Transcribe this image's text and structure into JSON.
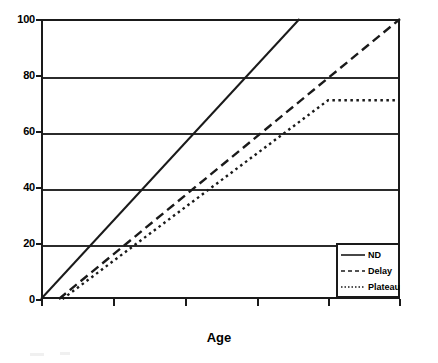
{
  "chart_data": {
    "type": "line",
    "title": "",
    "xlabel": "Age",
    "ylabel": "",
    "ylim": [
      0,
      100
    ],
    "xlim": [
      0,
      100
    ],
    "grid": true,
    "y_ticks": [
      0,
      20,
      40,
      60,
      80,
      100
    ],
    "y_tick_labels": [
      "0",
      "20",
      "40",
      "60",
      "80",
      "100"
    ],
    "x_ticks": [
      0,
      20,
      40,
      60,
      80,
      100
    ],
    "x_tick_labels": [
      "",
      "",
      "",
      "",
      "",
      ""
    ],
    "legend_position": "lower right",
    "series": [
      {
        "name": "ND",
        "style": "solid",
        "color": "#1a1a1a",
        "x": [
          0,
          72
        ],
        "y": [
          0,
          100
        ]
      },
      {
        "name": "Delay",
        "style": "dashed",
        "color": "#1a1a1a",
        "x": [
          5,
          100
        ],
        "y": [
          0,
          100
        ]
      },
      {
        "name": "Plateau",
        "style": "dotted",
        "color": "#1a1a1a",
        "x": [
          6,
          80,
          100
        ],
        "y": [
          0,
          71,
          71
        ]
      }
    ]
  },
  "axis": {
    "y_labels": [
      "100",
      "80",
      "60",
      "40",
      "20",
      "0"
    ],
    "x_title": "Age"
  },
  "legend": {
    "items": [
      {
        "label": "ND",
        "style": "solid"
      },
      {
        "label": "Delay",
        "style": "dashed"
      },
      {
        "label": "Plateau",
        "style": "dotted"
      }
    ]
  },
  "colors": {
    "line": "#1a1a1a",
    "grid": "#2b2b2b",
    "frame": "#1a1a1a",
    "background": "#ffffff"
  }
}
